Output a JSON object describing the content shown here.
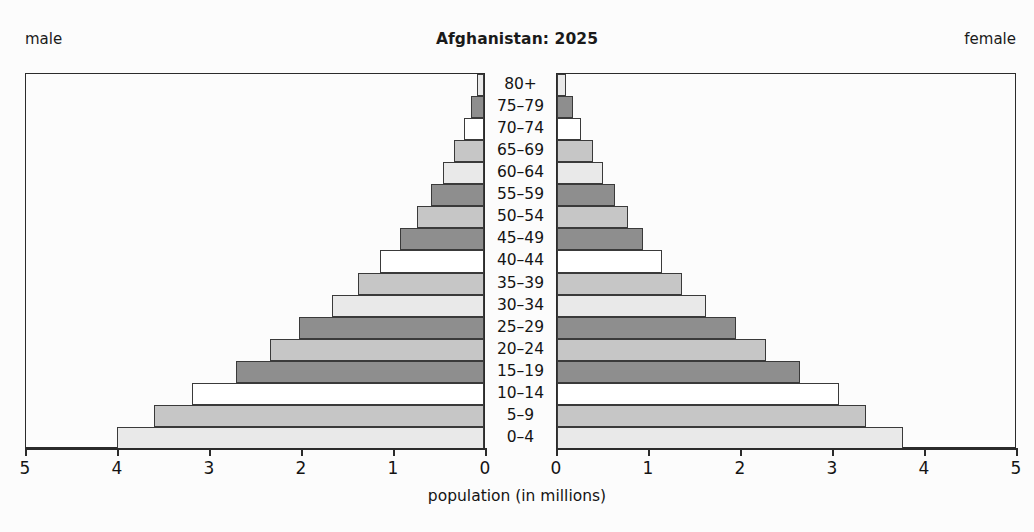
{
  "header": {
    "left_label": "male",
    "right_label": "female",
    "title": "Afghanistan: 2025"
  },
  "axis": {
    "title": "population (in millions)",
    "tick_labels_left": [
      "5",
      "4",
      "3",
      "2",
      "1",
      "0"
    ],
    "tick_labels_right": [
      "0",
      "1",
      "2",
      "3",
      "4",
      "5"
    ],
    "max": 5,
    "unit": "millions"
  },
  "source_note": "",
  "colors": {
    "shade_dark": "#8e8e8e",
    "shade_medium": "#c6c6c6",
    "shade_light": "#e9e9e9",
    "shade_white": "#ffffff",
    "outline": "#3a3a3a",
    "frame": "#2b2b2b",
    "text": "#141414",
    "background": "#fcfcfc"
  },
  "chart_data": {
    "type": "bar",
    "subtype": "population-pyramid",
    "title": "Afghanistan: 2025",
    "xlabel": "population (in millions)",
    "ylabel": "",
    "xlim": [
      0,
      5
    ],
    "grid": false,
    "legend": "none",
    "orientation": "horizontal",
    "categories": [
      "80+",
      "75-79",
      "70-74",
      "65-69",
      "60-64",
      "55-59",
      "50-54",
      "45-49",
      "40-44",
      "35-39",
      "30-34",
      "25-29",
      "20-24",
      "15-19",
      "10-14",
      "5-9",
      "0-4"
    ],
    "series": [
      {
        "name": "male",
        "side": "left",
        "values": [
          0.08,
          0.14,
          0.22,
          0.33,
          0.45,
          0.58,
          0.73,
          0.91,
          1.13,
          1.37,
          1.65,
          2.01,
          2.33,
          2.7,
          3.17,
          3.59,
          3.99
        ]
      },
      {
        "name": "female",
        "side": "right",
        "values": [
          0.1,
          0.17,
          0.26,
          0.39,
          0.5,
          0.63,
          0.77,
          0.94,
          1.14,
          1.36,
          1.62,
          1.95,
          2.27,
          2.64,
          3.07,
          3.36,
          3.76
        ]
      }
    ],
    "shades": [
      2,
      0,
      3,
      1,
      2,
      0,
      1,
      0,
      3,
      1,
      2,
      0,
      1,
      0,
      3,
      1,
      2
    ]
  }
}
